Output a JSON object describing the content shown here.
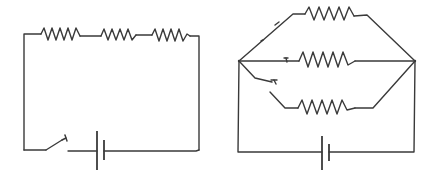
{
  "diagram": {
    "title": "",
    "colors": {
      "line": "#3a3a3a",
      "background": "#ffffff"
    },
    "circuits": [
      {
        "id": "series-circuit",
        "description": "Series circuit: three resistors in series with a switch and a single-cell battery",
        "components": [
          {
            "type": "resistor",
            "label": ""
          },
          {
            "type": "resistor",
            "label": ""
          },
          {
            "type": "resistor",
            "label": ""
          },
          {
            "type": "switch",
            "state": "open",
            "label": ""
          },
          {
            "type": "battery-cell",
            "label": ""
          }
        ]
      },
      {
        "id": "parallel-circuit",
        "description": "Parallel circuit: three resistor branches between two nodes, one branch with an open switch, powered by a single-cell battery",
        "components": [
          {
            "type": "resistor",
            "branch": "top",
            "label": ""
          },
          {
            "type": "resistor",
            "branch": "middle",
            "label": ""
          },
          {
            "type": "resistor",
            "branch": "bottom",
            "label": ""
          },
          {
            "type": "switch",
            "branch": "bottom",
            "state": "open",
            "label": ""
          },
          {
            "type": "battery-cell",
            "label": ""
          }
        ]
      }
    ]
  }
}
